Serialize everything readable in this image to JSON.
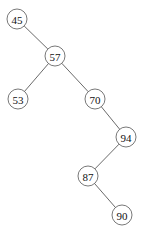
{
  "diagram": {
    "type": "binary-search-tree",
    "node_radius": 10,
    "nodes": [
      {
        "id": "n45",
        "label": "45",
        "x": 17,
        "y": 19
      },
      {
        "id": "n57",
        "label": "57",
        "x": 55,
        "y": 56
      },
      {
        "id": "n53",
        "label": "53",
        "x": 18,
        "y": 99
      },
      {
        "id": "n70",
        "label": "70",
        "x": 95,
        "y": 99
      },
      {
        "id": "n94",
        "label": "94",
        "x": 126,
        "y": 137
      },
      {
        "id": "n87",
        "label": "87",
        "x": 88,
        "y": 176
      },
      {
        "id": "n90",
        "label": "90",
        "x": 122,
        "y": 215
      }
    ],
    "edges": [
      {
        "from": "n45",
        "to": "n57",
        "side": "right"
      },
      {
        "from": "n57",
        "to": "n53",
        "side": "left"
      },
      {
        "from": "n57",
        "to": "n70",
        "side": "right"
      },
      {
        "from": "n70",
        "to": "n94",
        "side": "right"
      },
      {
        "from": "n94",
        "to": "n87",
        "side": "left"
      },
      {
        "from": "n87",
        "to": "n90",
        "side": "right"
      }
    ]
  }
}
